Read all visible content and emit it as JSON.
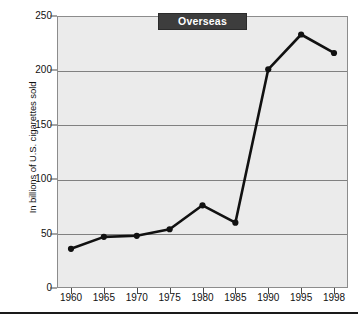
{
  "chart_data": {
    "type": "line",
    "title": "Overseas",
    "xlabel": "",
    "ylabel": "In billions of U.S. cigarettes sold",
    "categories": [
      "1960",
      "1965",
      "1970",
      "1975",
      "1980",
      "1985",
      "1990",
      "1995",
      "1998"
    ],
    "x": [
      1960,
      1965,
      1970,
      1975,
      1980,
      1985,
      1990,
      1995,
      1998
    ],
    "values": [
      36,
      47,
      48,
      54,
      76,
      60,
      201,
      233,
      216
    ],
    "series": [
      {
        "name": "Overseas",
        "values": [
          36,
          47,
          48,
          54,
          76,
          60,
          201,
          233,
          216
        ]
      }
    ],
    "ylim": [
      0,
      250
    ],
    "yticks": [
      0,
      50,
      100,
      150,
      200,
      250
    ],
    "ytick_labels": [
      "0",
      "50",
      "100",
      "150",
      "200",
      "250"
    ],
    "xtick_labels": [
      "1960",
      "1965",
      "1970",
      "1975",
      "1980",
      "1985",
      "1990",
      "1995",
      "1998"
    ],
    "grid": "horizontal",
    "legend": "none",
    "marker": "filled-circle",
    "line_color": "#111111",
    "marker_color": "#111111",
    "plot_background": "#ebebeb",
    "grid_color": "#808080",
    "title_background": "#3d3d3d",
    "title_color": "#ffffff"
  }
}
